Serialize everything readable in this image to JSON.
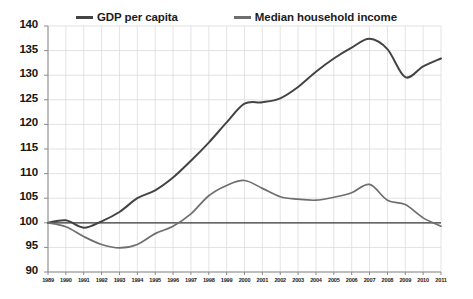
{
  "chart_data": {
    "type": "line",
    "title": "",
    "xlabel": "",
    "ylabel": "",
    "grid": true,
    "legend_position": "top",
    "ylim": [
      90,
      140
    ],
    "yticks": [
      90,
      95,
      100,
      105,
      110,
      115,
      120,
      125,
      130,
      135,
      140
    ],
    "xlim": [
      1989,
      2011
    ],
    "x": [
      1989,
      1990,
      1991,
      1992,
      1993,
      1994,
      1995,
      1996,
      1997,
      1998,
      1999,
      2000,
      2001,
      2002,
      2003,
      2004,
      2005,
      2006,
      2007,
      2008,
      2009,
      2010,
      2011
    ],
    "categories": [
      "1989",
      "1990",
      "1991",
      "1992",
      "1993",
      "1994",
      "1995",
      "1996",
      "1997",
      "1998",
      "1999",
      "2000",
      "2001",
      "2002",
      "2003",
      "2004",
      "2005",
      "2006",
      "2007",
      "2008",
      "2009",
      "2010",
      "2011"
    ],
    "reference_line": 100,
    "series": [
      {
        "name": "GDP per capita",
        "color": "#434343",
        "values": [
          100.0,
          100.5,
          99.0,
          100.3,
          102.2,
          105.0,
          106.6,
          109.2,
          112.6,
          116.3,
          120.4,
          124.2,
          124.5,
          125.3,
          127.6,
          130.7,
          133.4,
          135.6,
          137.4,
          135.3,
          129.6,
          131.8,
          133.4
        ]
      },
      {
        "name": "Median household income",
        "color": "#6e6e6e",
        "values": [
          100.0,
          99.2,
          97.2,
          95.6,
          94.9,
          95.6,
          97.8,
          99.3,
          101.8,
          105.5,
          107.6,
          108.6,
          107.0,
          105.3,
          104.8,
          104.6,
          105.2,
          106.1,
          107.8,
          104.6,
          103.7,
          101.0,
          99.3
        ]
      }
    ]
  },
  "legend": {
    "items": [
      {
        "label": "GDP per capita"
      },
      {
        "label": "Median household income"
      }
    ]
  }
}
